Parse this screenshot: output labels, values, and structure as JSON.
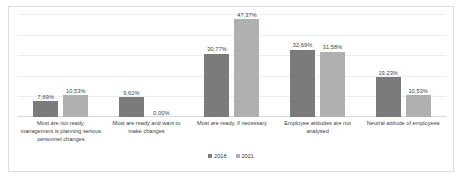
{
  "chart_data": {
    "type": "bar",
    "title": "",
    "xlabel": "",
    "ylabel": "",
    "ylim": [
      0,
      50
    ],
    "grid": true,
    "legend_position": "bottom",
    "categories": [
      "Most are not ready, management is planning serious personnel changes",
      "Most are ready and want to make changes",
      "Most are ready, if necessary",
      "Employee attitudes are not analysed",
      "Neutral attitude of employees"
    ],
    "series": [
      {
        "name": "2018",
        "color": "#7b7b7b",
        "values": [
          7.69,
          9.62,
          30.77,
          32.69,
          19.23
        ],
        "labels": [
          "7,69%",
          "9,62%",
          "30,77%",
          "32,69%",
          "19,23%"
        ]
      },
      {
        "name": "2021",
        "color": "#b0b0b0",
        "values": [
          10.53,
          0.0,
          47.37,
          31.58,
          10.53
        ],
        "labels": [
          "10,53%",
          "0,00%",
          "47,37%",
          "31,58%",
          "10,53%"
        ]
      }
    ]
  },
  "legend": {
    "items": [
      {
        "label": "2018"
      },
      {
        "label": "2021"
      }
    ]
  }
}
